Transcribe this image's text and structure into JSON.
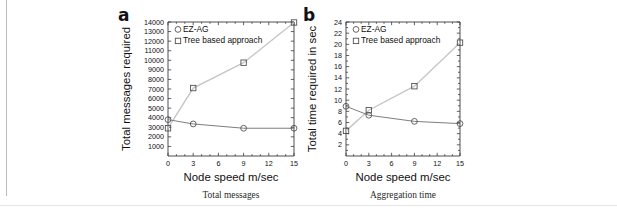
{
  "figure": {
    "panels": [
      {
        "letter": "a",
        "caption": "Total messages",
        "xlabel": "Node speed m/sec",
        "ylabel": "Total messages required"
      },
      {
        "letter": "b",
        "caption": "Aggregation time",
        "xlabel": "Node speed m/sec",
        "ylabel": "Total time required in sec"
      }
    ],
    "legend": {
      "ez_label": "EZ-AG",
      "tree_label": "Tree based approach",
      "ez_marker": "circle-marker",
      "tree_marker": "square-marker"
    },
    "colors": {
      "ez_line": "#6f6f6f",
      "tree_line": "#c6c6c6",
      "axis": "#3b3b3b",
      "text": "#111111"
    }
  },
  "chart_data": [
    {
      "type": "line",
      "panel": "a",
      "title": "Total messages",
      "xlabel": "Node speed m/sec",
      "ylabel": "Total messages required",
      "x": [
        0,
        3,
        9,
        15
      ],
      "xticks": [
        0,
        3,
        6,
        9,
        12,
        15
      ],
      "yticks": [
        1000,
        2000,
        3000,
        4000,
        5000,
        6000,
        7000,
        8000,
        9000,
        10000,
        11000,
        12000,
        13000,
        14000
      ],
      "xlim": [
        0,
        15
      ],
      "ylim": [
        0,
        14000
      ],
      "grid": false,
      "legend_position": "top-left",
      "series": [
        {
          "name": "EZ-AG",
          "marker": "circle",
          "values": [
            3800,
            3350,
            2900,
            2900
          ]
        },
        {
          "name": "Tree based approach",
          "marker": "square",
          "values": [
            2900,
            7100,
            9750,
            13950
          ]
        }
      ]
    },
    {
      "type": "line",
      "panel": "b",
      "title": "Aggregation time",
      "xlabel": "Node speed m/sec",
      "ylabel": "Total time required in sec",
      "x": [
        0,
        3,
        9,
        15
      ],
      "xticks": [
        0,
        3,
        6,
        9,
        12,
        15
      ],
      "yticks": [
        2,
        4,
        6,
        8,
        10,
        12,
        14,
        16,
        18,
        20,
        22,
        24
      ],
      "xlim": [
        0,
        15
      ],
      "ylim": [
        0,
        24
      ],
      "grid": false,
      "legend_position": "top-left",
      "series": [
        {
          "name": "EZ-AG",
          "marker": "circle",
          "values": [
            8.9,
            7.3,
            6.2,
            5.8
          ]
        },
        {
          "name": "Tree based approach",
          "marker": "square",
          "values": [
            4.5,
            8.2,
            12.5,
            20.3
          ]
        }
      ]
    }
  ]
}
